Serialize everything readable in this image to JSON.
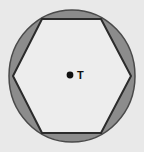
{
  "figure": {
    "type": "geometry-diagram",
    "background_color": "#e9e9e9",
    "circle": {
      "name": "circumscribed-circle",
      "center_x": 72,
      "center_y": 76,
      "radius_x": 63,
      "radius_y": 66,
      "fill_color": "#8c8c8c",
      "stroke_color": "#4a4a4a",
      "stroke_width": 1.5
    },
    "hexagon": {
      "name": "inscribed-hexagon",
      "sides": 6,
      "fill_color": "#ededed",
      "stroke_color": "#2b2b2b",
      "stroke_width": 2,
      "vertices": [
        {
          "x": 101,
          "y": 19
        },
        {
          "x": 131,
          "y": 76
        },
        {
          "x": 101,
          "y": 133
        },
        {
          "x": 42,
          "y": 133
        },
        {
          "x": 13,
          "y": 76
        },
        {
          "x": 42,
          "y": 19
        }
      ]
    },
    "center_point": {
      "name": "point-T",
      "label": "T",
      "x": 70,
      "y": 75,
      "radius": 3.4,
      "color": "#101010"
    }
  }
}
